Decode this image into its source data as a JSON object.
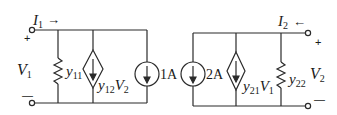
{
  "diagram": {
    "type": "two-port-y-parameter-circuit",
    "colors": {
      "stroke": "#2a2a2a",
      "background": "#ffffff"
    },
    "port1": {
      "current_label": "I",
      "current_sub": "1",
      "current_arrow": "→",
      "voltage_label": "V",
      "voltage_sub": "1",
      "plus": "+",
      "minus": "—"
    },
    "port2": {
      "current_label": "I",
      "current_sub": "2",
      "current_arrow": "←",
      "voltage_label": "V",
      "voltage_sub": "2",
      "plus": "+",
      "minus": "—"
    },
    "elements": {
      "y11": {
        "label": "y",
        "sub": "11",
        "kind": "resistor"
      },
      "y12": {
        "label": "y",
        "sub": "12",
        "dep": "V",
        "dep_sub": "2",
        "kind": "dependent-current-source"
      },
      "src1": {
        "label": "1A",
        "kind": "current-source"
      },
      "src2": {
        "label": "2A",
        "kind": "current-source"
      },
      "y21": {
        "label": "y",
        "sub": "21",
        "dep": "V",
        "dep_sub": "1",
        "kind": "dependent-current-source"
      },
      "y22": {
        "label": "y",
        "sub": "22",
        "kind": "resistor"
      }
    }
  }
}
